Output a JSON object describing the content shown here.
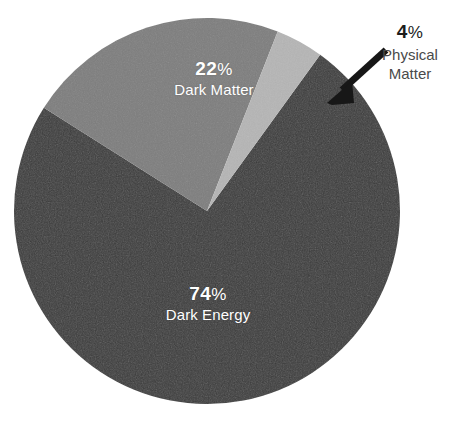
{
  "chart_data": {
    "type": "pie",
    "title": "",
    "subtitle": "",
    "xlabel": "",
    "ylabel": "",
    "legend_position": "none",
    "grid": false,
    "units": "percent",
    "total": 100,
    "center": {
      "x": 207,
      "y": 211
    },
    "radius": 193,
    "categories": [
      "Dark Energy",
      "Dark Matter",
      "Physical Matter"
    ],
    "values": [
      74,
      22,
      4
    ],
    "slices": [
      {
        "label": "Dark Energy",
        "value": 74,
        "value_text": "74",
        "percent_symbol": "%",
        "color": "#3b3b3b",
        "text_color": "#ffffff",
        "label_placement": "inside",
        "start_angle_deg": 61.2,
        "end_angle_deg": 327.6
      },
      {
        "label": "Dark Matter",
        "value": 22,
        "value_text": "22",
        "percent_symbol": "%",
        "color": "#7d7d7d",
        "text_color": "#ffffff",
        "label_placement": "inside",
        "start_angle_deg": 327.6,
        "end_angle_deg": 446.8
      },
      {
        "label": "Physical Matter",
        "value": 4,
        "value_text": "4",
        "percent_symbol": "%",
        "color": "#b5b5b5",
        "text_color": "#1d1d1d",
        "label_placement": "callout",
        "start_angle_deg": 446.8,
        "end_angle_deg": 468.0
      }
    ],
    "annotations": [
      {
        "type": "arrow",
        "text": "4% Physical Matter",
        "color": "#171717",
        "points_to": "Physical Matter",
        "from": {
          "x": 384,
          "y": 52
        },
        "to": {
          "x": 330,
          "y": 101
        }
      }
    ]
  },
  "labels": {
    "dark_matter": {
      "percent": "22",
      "percent_symbol": "%",
      "name": "Dark Matter"
    },
    "dark_energy": {
      "percent": "74",
      "percent_symbol": "%",
      "name": "Dark Energy"
    },
    "physical_matter": {
      "percent": "4",
      "percent_symbol": "%",
      "name_line1": "Physical",
      "name_line2": "Matter"
    }
  },
  "colors": {
    "dark_energy": "#3b3b3b",
    "dark_matter": "#7d7d7d",
    "physical_matter": "#b5b5b5",
    "background": "#ffffff",
    "arrow": "#171717",
    "callout_percent_text": "#1d1d1d",
    "callout_name_text": "#4a4a4a",
    "inside_label_text": "#ffffff"
  }
}
